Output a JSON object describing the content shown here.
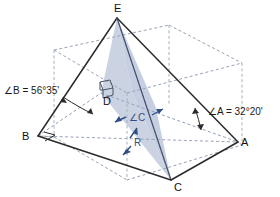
{
  "figure": {
    "type": "geometry-diagram",
    "colors": {
      "solid_edge": "#2b2b2b",
      "dashed_edge": "#8c99ad",
      "shaded_face": "#b9c4da",
      "shaded_face_stroke": "#7f8fb0",
      "annotation_blue": "#2f4f84",
      "text": "#1a1a1a",
      "background": "#ffffff"
    },
    "vertices": [
      {
        "id": "E",
        "label": "E",
        "x": 120,
        "y": 13
      },
      {
        "id": "B",
        "label": "B",
        "x": 24,
        "y": 138
      },
      {
        "id": "A",
        "label": "A",
        "x": 243,
        "y": 143
      },
      {
        "id": "C",
        "label": "C",
        "x": 177,
        "y": 188
      },
      {
        "id": "D",
        "label": "D",
        "x": 105,
        "y": 103
      }
    ],
    "annotations": [
      {
        "id": "angle-b",
        "label": "∠B = 56°35'",
        "x": 4,
        "y": 88
      },
      {
        "id": "angle-a",
        "label": "∠A = 32°20'",
        "x": 194,
        "y": 108
      },
      {
        "id": "angle-c",
        "label": "∠C",
        "x": 130,
        "y": 114
      },
      {
        "id": "segment-r",
        "label": "R",
        "x": 134,
        "y": 140
      }
    ],
    "measures": {
      "angle_B_degrees": 56,
      "angle_B_minutes": 35,
      "angle_A_degrees": 32,
      "angle_A_minutes": 20
    },
    "markers": [
      {
        "id": "right-angle-at-b",
        "type": "right-angle"
      },
      {
        "id": "right-angle-at-d",
        "type": "right-angle-3d"
      }
    ]
  }
}
